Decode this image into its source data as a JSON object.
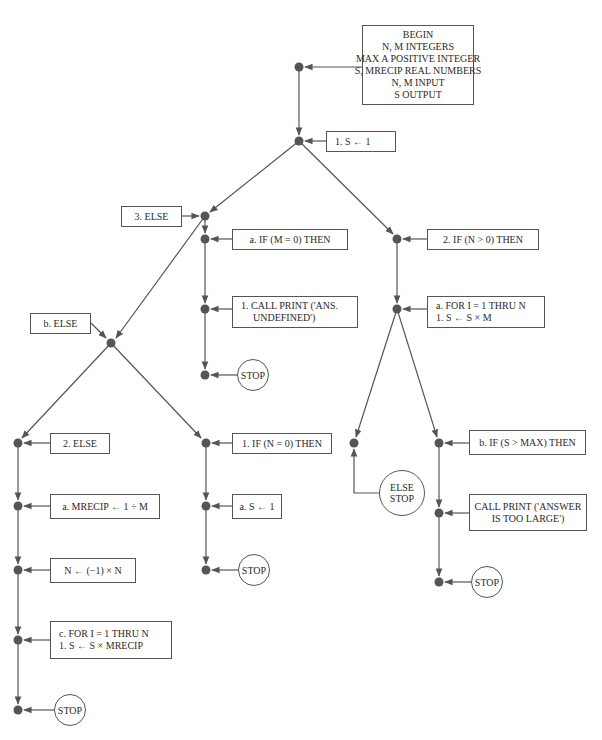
{
  "diagram": {
    "type": "flowchart",
    "colors": {
      "line": "#555555",
      "node": "#555555",
      "text": "#2a2a2a",
      "background": "#ffffff"
    },
    "boxes": {
      "begin": {
        "lines": [
          "BEGIN",
          "N, M INTEGERS",
          "MAX A POSITIVE INTEGER",
          "S, MRECIP REAL NUMBERS",
          "N, M INPUT",
          "S OUTPUT"
        ]
      },
      "step1": {
        "lines": [
          "1.  S ← 1"
        ]
      },
      "step3_else": {
        "lines": [
          "3.  ELSE"
        ]
      },
      "step_a_if_m0": {
        "lines": [
          "a.  IF (M = 0) THEN"
        ]
      },
      "step_call_print_ans": {
        "lines": [
          "1.  CALL PRINT ('ANS.",
          "UNDEFINED')"
        ]
      },
      "step2_if_n_gt_0": {
        "lines": [
          "2.  IF (N > 0) THEN"
        ]
      },
      "step_a_for": {
        "lines": [
          "a.  FOR I = 1 THRU N",
          "1.  S ← S × M"
        ]
      },
      "step_b_else": {
        "lines": [
          "b.  ELSE"
        ]
      },
      "step2_else": {
        "lines": [
          "2.  ELSE"
        ]
      },
      "step_a_mrecip": {
        "lines": [
          "a.  MRECIP ← 1 ÷ M"
        ]
      },
      "step_n_neg": {
        "lines": [
          "N ← (−1) × N"
        ]
      },
      "step_c_for": {
        "lines": [
          "c.  FOR I = 1 THRU N",
          "1.  S ← S × MRECIP"
        ]
      },
      "step1_if_n0": {
        "lines": [
          "1.  IF (N = 0) THEN"
        ]
      },
      "step_a_s1": {
        "lines": [
          "a.  S ← 1"
        ]
      },
      "step_b_if_s_gt_max": {
        "lines": [
          "b.  IF (S > MAX) THEN"
        ]
      },
      "step_call_print_answer": {
        "lines": [
          "CALL PRINT ('ANSWER",
          "IS TOO LARGE')"
        ]
      }
    },
    "terminals": {
      "stop_m0": {
        "lines": [
          "STOP"
        ]
      },
      "stop_n0": {
        "lines": [
          "STOP"
        ]
      },
      "stop_recip": {
        "lines": [
          "STOP"
        ]
      },
      "else_stop": {
        "lines": [
          "ELSE",
          "STOP"
        ]
      },
      "stop_large": {
        "lines": [
          "STOP"
        ]
      }
    }
  }
}
